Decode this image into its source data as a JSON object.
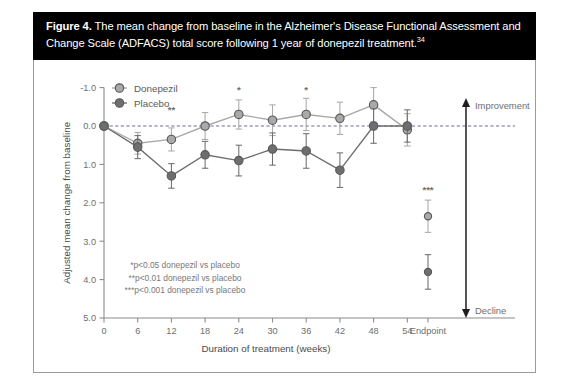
{
  "caption": {
    "figure_label": "Figure 4.",
    "text": " The mean change from baseline in the Alzheimer's Disease Functional Assessment and Change Scale (ADFACS) total score following 1 year of donepezil treatment.",
    "reference": "34"
  },
  "chart_data": {
    "type": "line",
    "title": "",
    "xlabel": "Duration of treatment (weeks)",
    "ylabel": "Adjusted mean change from baseline",
    "categories": [
      "0",
      "6",
      "12",
      "18",
      "24",
      "30",
      "36",
      "42",
      "48",
      "54",
      "Endpoint"
    ],
    "y_ticks": [
      "-1.0",
      "0.0",
      "1.0",
      "2.0",
      "3.0",
      "4.0",
      "5.0"
    ],
    "ylim": [
      -1.0,
      5.0
    ],
    "y_inverted": true,
    "grid": false,
    "zero_reference_line": 0.0,
    "legend_position": "top-left",
    "series": [
      {
        "name": "Donepezil",
        "color": "#a9a9a9",
        "values": [
          0.0,
          0.45,
          0.35,
          0.0,
          -0.3,
          -0.15,
          -0.3,
          -0.2,
          -0.55,
          0.1,
          2.35
        ],
        "errors": [
          0.0,
          0.28,
          0.3,
          0.35,
          0.38,
          0.4,
          0.42,
          0.42,
          0.45,
          0.42,
          0.42
        ]
      },
      {
        "name": "Placebo",
        "color": "#6e6e6e",
        "values": [
          0.0,
          0.55,
          1.3,
          0.75,
          0.9,
          0.6,
          0.65,
          1.15,
          0.0,
          0.0,
          3.8
        ],
        "errors": [
          0.0,
          0.3,
          0.32,
          0.35,
          0.4,
          0.42,
          0.45,
          0.45,
          0.45,
          0.42,
          0.45
        ]
      }
    ],
    "annotations": [
      {
        "label": "**",
        "category": "12",
        "value": -0.35
      },
      {
        "label": "*",
        "category": "24",
        "value": -0.85
      },
      {
        "label": "*",
        "category": "36",
        "value": -0.85
      },
      {
        "label": "***",
        "category": "Endpoint",
        "value": 1.75
      }
    ],
    "direction_labels": {
      "top": "Improvement",
      "bottom": "Decline"
    },
    "footnotes": [
      "*p<0.05 donepezil vs placebo",
      "**p<0.01 donepezil vs placebo",
      "***p<0.001 donepezil vs placebo"
    ]
  }
}
